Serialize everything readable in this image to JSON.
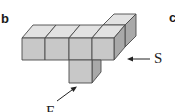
{
  "panel_labels": {
    "current": "b",
    "next_partial": "c"
  },
  "callouts": {
    "side_view": "S",
    "front_view": "F"
  },
  "colors": {
    "top_face": "#e2e2e2",
    "front_face": "#c8c8c8",
    "side_face": "#a9a9a9",
    "edges": "#4a4a4a",
    "arrows": "#222222"
  },
  "diagram": {
    "cube_count": 6
  }
}
